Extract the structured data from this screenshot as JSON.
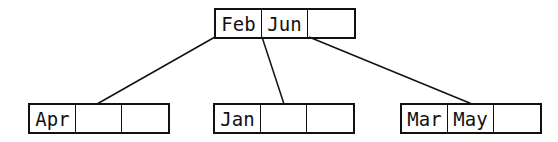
{
  "tree": {
    "root": {
      "keys": [
        "Feb",
        "Jun",
        ""
      ]
    },
    "children": [
      {
        "keys": [
          "Apr",
          "",
          ""
        ]
      },
      {
        "keys": [
          "Jan",
          "",
          ""
        ]
      },
      {
        "keys": [
          "Mar",
          "May",
          ""
        ]
      }
    ]
  }
}
